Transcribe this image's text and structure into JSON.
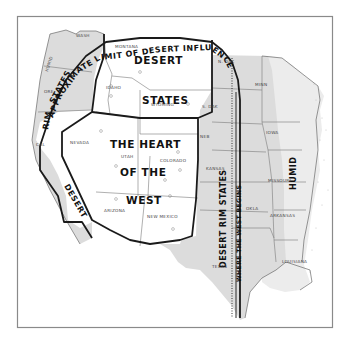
{
  "map": {
    "regions": {
      "desert_states_title": [
        "DESERT",
        "STATES"
      ],
      "heart_of_west_title": [
        "THE HEART",
        "OF THE",
        "WEST"
      ],
      "desert_rim_states_west": "DESERT RIM STATES",
      "desert_rim_states_east": "DESERT RIM STATES",
      "humid_northwest": "HUMID",
      "humid_east": "HUMID"
    },
    "boundaries": {
      "approximate_limit": "APPROXIMATE LIMIT OF DESERT INFLUENCE",
      "where_west_begins": "WHERE THE WEST BEGINS"
    },
    "states": {
      "wash": "WASH",
      "ore": "ORE",
      "cal": "CAL",
      "montana": "MONTANA",
      "idaho": "IDAHO",
      "wyoming": "WYOMING",
      "nevada": "NEVADA",
      "utah": "UTAH",
      "colorado": "COLORADO",
      "arizona": "ARIZONA",
      "new_mexico": "NEW MEXICO",
      "n_dak": "N. DAK",
      "s_dak": "S. DAK",
      "neb": "NEB",
      "kansas": "KANSAS",
      "okla": "OKLA",
      "texas": "TEXAS",
      "minn": "MINN",
      "iowa": "IOWA",
      "missouri": "MISSOURI",
      "arkansas": "ARKANSAS",
      "louisiana": "LOUISIANA"
    },
    "colors": {
      "rim_fill": "#dcdcdc",
      "humid_fill": "#ececec",
      "desert_fill": "#ffffff",
      "boundary": "#1a1a1a",
      "frame": "#8a8a8a"
    }
  }
}
